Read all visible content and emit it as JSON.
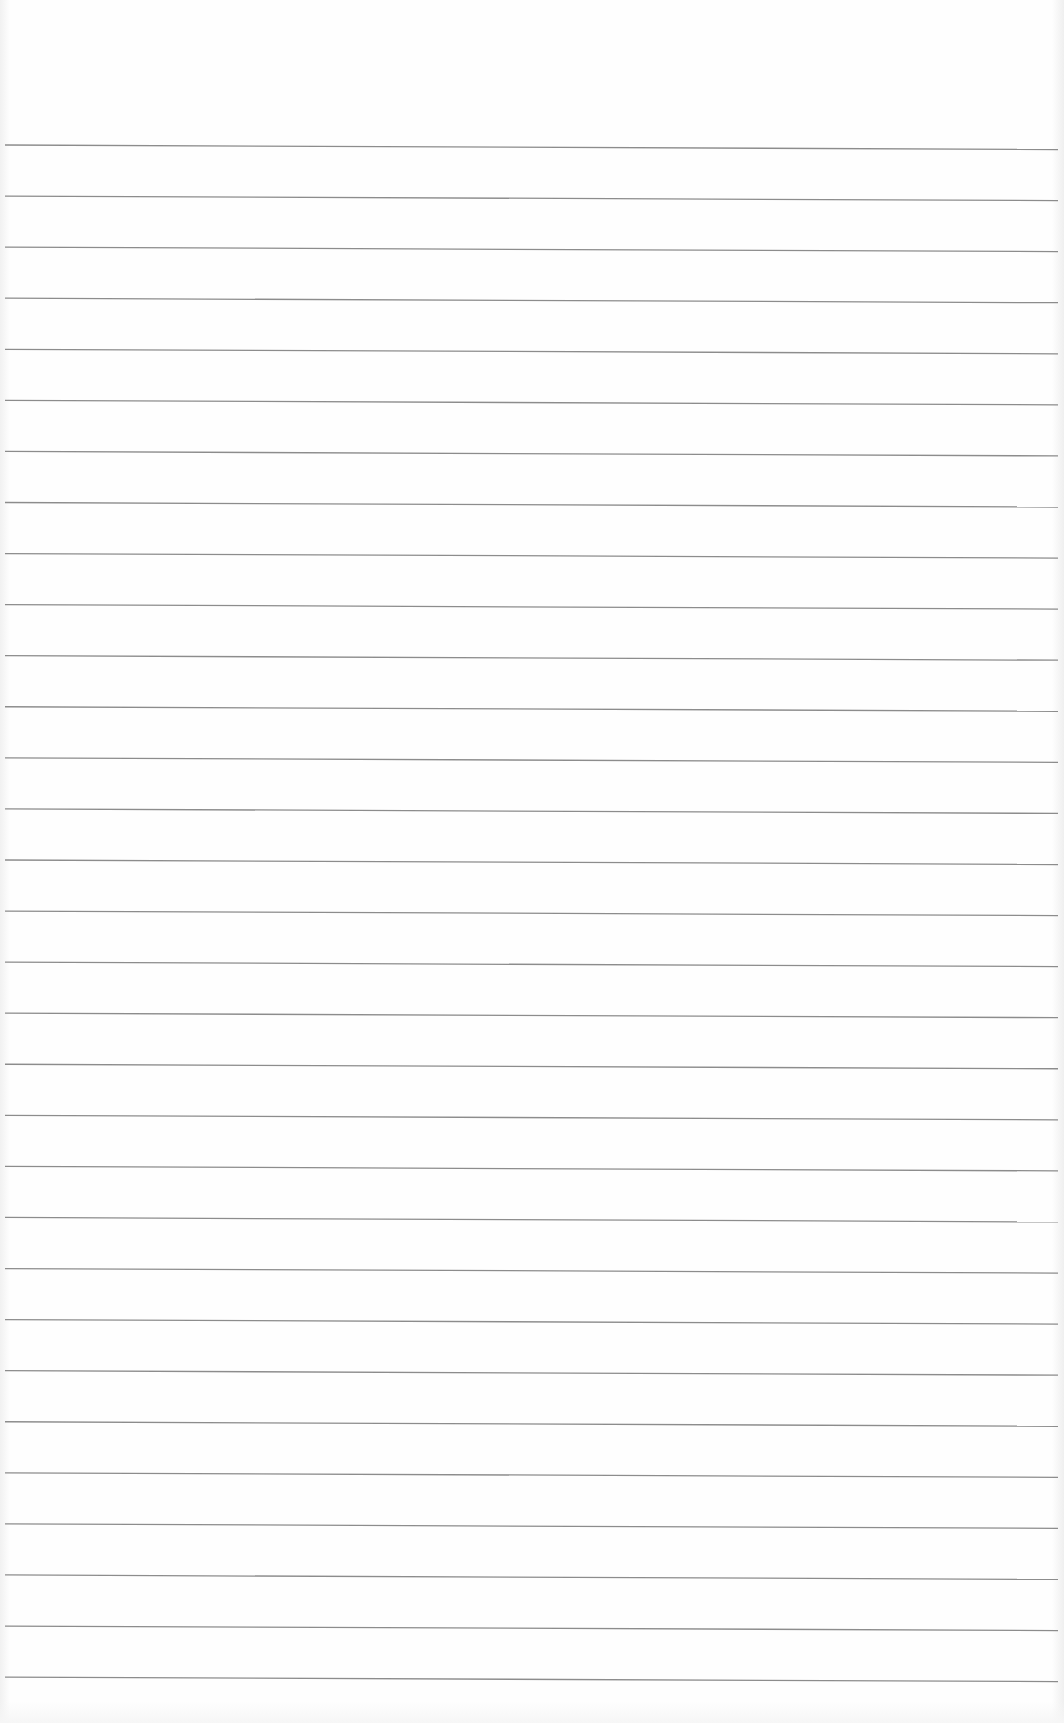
{
  "document": {
    "type": "lined-paper",
    "content_text": "",
    "rule_line": {
      "count": 31,
      "first_y_left": 145,
      "spacing": 51.07,
      "x_start": 5,
      "x_end": 1058,
      "slope_px": 4.5,
      "color": "#8c8c8c",
      "thickness": 1.3
    },
    "background_color": "#fefefe"
  }
}
